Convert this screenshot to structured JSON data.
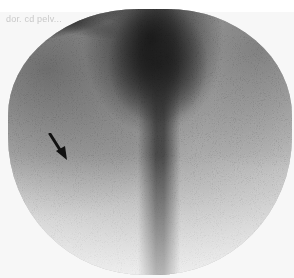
{
  "image": {
    "description": "Grayscale nuclear medicine scintigraphy (grainy circular field of view) showing a dark central vertical band branching into left and right limbs, with an arrow pointing at the left branch",
    "label_text": "dor. cd pelv...",
    "annotation": {
      "type": "arrow",
      "color": "#111111",
      "direction": "down-right",
      "target": "left-branch-uptake"
    },
    "colors": {
      "background": "#f7f7f7",
      "field_of_view": "#bdbdbd",
      "uptake_dark": "#141414"
    }
  }
}
